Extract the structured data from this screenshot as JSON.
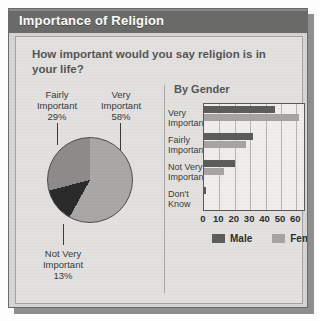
{
  "card": {
    "title": "Importance of Religion",
    "question": "How important would you say religion is in your life?"
  },
  "pie_labels": {
    "fairly": "Fairly\nImportant\n29%",
    "fairly_name": "Fairly",
    "fairly_word": "Important",
    "fairly_pct": "29%",
    "very_name": "Very",
    "very_word": "Important",
    "very_pct": "58%",
    "notvery_name": "Not Very",
    "notvery_word": "Important",
    "notvery_pct": "13%"
  },
  "bar_section": {
    "heading": "By Gender"
  },
  "categories_display": [
    {
      "l1": "Very",
      "l2": "Important"
    },
    {
      "l1": "Fairly",
      "l2": "Important"
    },
    {
      "l1": "Not Very",
      "l2": "Important"
    },
    {
      "l1": "Don't",
      "l2": "Know"
    }
  ],
  "legend": {
    "male": "Male",
    "female": "Female"
  },
  "colors": {
    "title_bar": "#6b6b69",
    "card_bg": "#d6d5d3",
    "panel_bg": "#e2e1df",
    "male": "#5d5d5b",
    "female": "#a6a5a3",
    "pie_very": "#a9a8a6",
    "pie_fairly": "#8d8c8a",
    "pie_notvery": "#2b2b2b"
  },
  "chart_data": [
    {
      "type": "pie",
      "title": "How important would you say religion is in your life?",
      "labels": [
        "Very Important",
        "Fairly Important",
        "Not Very Important"
      ],
      "values": [
        58,
        29,
        13
      ],
      "value_suffix": "%",
      "colors": [
        "#a9a8a6",
        "#8d8c8a",
        "#2b2b2b"
      ],
      "legend": "labels-with-leader-lines"
    },
    {
      "type": "bar",
      "orientation": "horizontal",
      "title": "By Gender",
      "categories": [
        "Very Important",
        "Fairly Important",
        "Not Very Important",
        "Don't Know"
      ],
      "series": [
        {
          "name": "Male",
          "values": [
            46,
            32,
            20,
            1
          ],
          "color": "#5d5d5b"
        },
        {
          "name": "Female",
          "values": [
            62,
            27,
            13,
            0
          ],
          "color": "#a6a5a3"
        }
      ],
      "xlabel": "",
      "ylabel": "",
      "xlim": [
        0,
        65
      ],
      "xticks": [
        "0",
        "10",
        "20",
        "30",
        "40",
        "50",
        "60"
      ],
      "xtick_values": [
        0,
        10,
        20,
        30,
        40,
        50,
        60
      ],
      "grid": "vertical",
      "legend_position": "bottom"
    }
  ]
}
